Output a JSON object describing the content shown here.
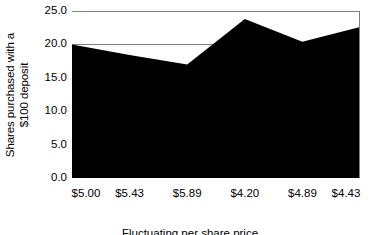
{
  "chart_data": {
    "type": "area",
    "title": "",
    "xlabel": "Fluctuating per share price",
    "ylabel": "Shares purchased with a $100 deposit",
    "ylabel_line1": "Shares purchased with a",
    "ylabel_line2": "$100 deposit",
    "categories": [
      "$5.00",
      "$5.43",
      "$5.89",
      "$4.20",
      "$4.89",
      "$4.43"
    ],
    "values": [
      20.0,
      18.4,
      17.0,
      23.8,
      20.4,
      22.6
    ],
    "ylim": [
      0.0,
      25.0
    ],
    "yticks": [
      "0.0",
      "5.0",
      "10.0",
      "15.0",
      "20.0",
      "25.0"
    ],
    "ytick_values": [
      0.0,
      5.0,
      10.0,
      15.0,
      20.0,
      25.0
    ],
    "grid": true,
    "legend": "none",
    "series_color": "#000000",
    "grid_color": "#808080",
    "background_color": "#ffffff"
  }
}
